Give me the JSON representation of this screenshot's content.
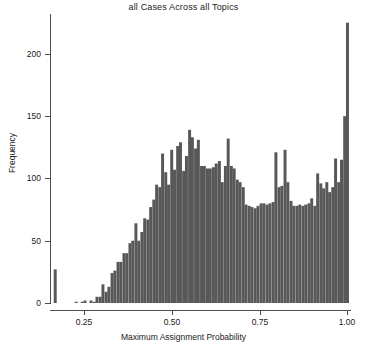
{
  "chart_data": {
    "type": "bar",
    "title": "all Cases Across all Topics",
    "xlabel": "Maximum Assignment Probability",
    "ylabel": "Frequency",
    "xlim": [
      0.155,
      1.01
    ],
    "ylim": [
      0,
      232
    ],
    "grid": false,
    "legend": null,
    "bar_color": "#585858",
    "bin_width": 0.00845,
    "xticks": [
      0.25,
      0.5,
      0.75,
      1.0
    ],
    "xtick_labels": [
      "0.25",
      "0.50",
      "0.75",
      "1.00"
    ],
    "yticks": [
      0,
      50,
      100,
      150,
      200
    ],
    "ytick_labels": [
      "0",
      "50",
      "100",
      "150",
      "200"
    ],
    "x": [
      0.167,
      0.176,
      0.184,
      0.193,
      0.201,
      0.21,
      0.218,
      0.227,
      0.235,
      0.244,
      0.252,
      0.261,
      0.269,
      0.278,
      0.286,
      0.295,
      0.303,
      0.312,
      0.32,
      0.329,
      0.337,
      0.346,
      0.354,
      0.363,
      0.371,
      0.38,
      0.388,
      0.397,
      0.405,
      0.414,
      0.422,
      0.431,
      0.439,
      0.448,
      0.456,
      0.465,
      0.473,
      0.482,
      0.49,
      0.499,
      0.507,
      0.516,
      0.524,
      0.533,
      0.541,
      0.55,
      0.558,
      0.567,
      0.575,
      0.584,
      0.592,
      0.601,
      0.609,
      0.618,
      0.626,
      0.635,
      0.643,
      0.652,
      0.66,
      0.669,
      0.677,
      0.686,
      0.694,
      0.703,
      0.711,
      0.72,
      0.728,
      0.737,
      0.745,
      0.754,
      0.762,
      0.771,
      0.779,
      0.788,
      0.796,
      0.805,
      0.813,
      0.822,
      0.83,
      0.839,
      0.847,
      0.856,
      0.864,
      0.873,
      0.881,
      0.89,
      0.898,
      0.907,
      0.915,
      0.924,
      0.932,
      0.941,
      0.949,
      0.958,
      0.966,
      0.975,
      0.983,
      0.992,
      1.0
    ],
    "values": [
      27,
      0,
      0,
      0,
      0,
      0,
      0,
      1,
      0,
      1,
      2,
      0,
      2,
      1,
      5,
      5,
      15,
      9,
      13,
      24,
      26,
      33,
      33,
      40,
      40,
      48,
      50,
      64,
      50,
      57,
      68,
      67,
      77,
      83,
      95,
      93,
      120,
      105,
      95,
      123,
      107,
      126,
      129,
      106,
      118,
      139,
      133,
      124,
      131,
      110,
      110,
      108,
      108,
      109,
      112,
      114,
      97,
      110,
      132,
      110,
      108,
      99,
      97,
      93,
      79,
      78,
      77,
      76,
      78,
      80,
      80,
      79,
      80,
      81,
      121,
      93,
      94,
      123,
      97,
      82,
      78,
      78,
      79,
      78,
      79,
      80,
      84,
      78,
      104,
      96,
      92,
      97,
      89,
      93,
      116,
      97,
      115,
      150,
      225
    ]
  }
}
